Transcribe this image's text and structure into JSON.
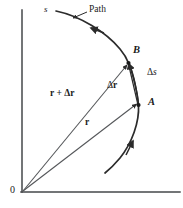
{
  "figure": {
    "background_color": "#ffffff",
    "stroke_color": "#2b2b2b",
    "text_color": "#1a1a1a"
  },
  "axes": {
    "origin_label": "0",
    "vertical_axis_name": "vertical-axis",
    "horizontal_axis_name": "horizontal-axis"
  },
  "labels": {
    "arc_length": "s",
    "path": "Path",
    "point_b": "B",
    "point_a": "A",
    "delta_s": "Δs",
    "delta_r": "Δr",
    "r_vector": "r",
    "r_plus_delta_r": "r + Δr"
  },
  "delta_s_parts": {
    "delta": "Δ",
    "symbol": "s"
  },
  "delta_r_parts": {
    "delta": "Δ",
    "symbol": "r"
  },
  "r_plus_parts": {
    "r": "r",
    "plus": " + ",
    "delta": "Δ",
    "r2": "r"
  },
  "geometry": {
    "point_a": {
      "x": 138,
      "y": 105
    },
    "point_b": {
      "x": 128,
      "y": 63
    },
    "origin": {
      "x": 22,
      "y": 192
    }
  }
}
